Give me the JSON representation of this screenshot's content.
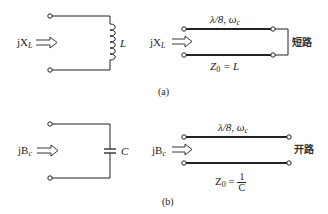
{
  "figure": {
    "panels": [
      {
        "caption": "(a)",
        "lumped": {
          "input_label": "jX",
          "input_sub": "L",
          "element_label": "L",
          "element_type": "inductor"
        },
        "line": {
          "input_label": "jX",
          "input_sub": "L",
          "top_label": "λ/8, ω",
          "top_sub": "c",
          "bottom_label_z": "Z",
          "bottom_label_sub": "0",
          "bottom_label_rest": " = L",
          "termination": "短路"
        }
      },
      {
        "caption": "(b)",
        "lumped": {
          "input_label": "jB",
          "input_sub": "c",
          "element_label": "C",
          "element_type": "capacitor"
        },
        "line": {
          "input_label": "jB",
          "input_sub": "c",
          "top_label": "λ/8, ω",
          "top_sub": "c",
          "bottom_label_z": "Z",
          "bottom_label_sub": "0",
          "bottom_label_eq": " = ",
          "frac_num": "1",
          "frac_den": "C",
          "termination": "开路"
        }
      }
    ]
  }
}
